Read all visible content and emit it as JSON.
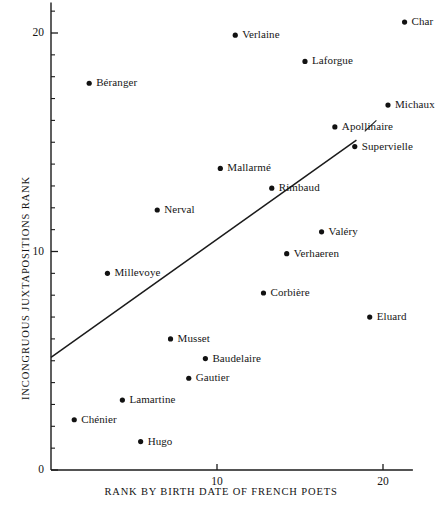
{
  "chart_data": {
    "type": "scatter",
    "title": "",
    "xlabel": "RANK BY BIRTH DATE OF FRENCH POETS",
    "ylabel": "INCONGRUOUS JUXTAPOSITIONS RANK",
    "xlim": [
      0,
      21.8
    ],
    "ylim": [
      0,
      21.4
    ],
    "xticks": [
      10,
      20
    ],
    "xtick_labels": [
      "10",
      "20"
    ],
    "yticks": [
      0,
      10,
      20
    ],
    "ytick_labels": [
      "0",
      "10",
      "20"
    ],
    "xtick_step_minor": 1,
    "ytick_step_minor": 1,
    "grid": false,
    "legend": "none",
    "point_color": "#121212",
    "line_color": "#1b1b1b",
    "axis_color": "#1b1b1b",
    "points": [
      {
        "label": "Char",
        "x": 21.3,
        "y": 20.5,
        "label_side": "right"
      },
      {
        "label": "Verlaine",
        "x": 11.1,
        "y": 19.9,
        "label_side": "right"
      },
      {
        "label": "Laforgue",
        "x": 15.3,
        "y": 18.7,
        "label_side": "right"
      },
      {
        "label": "Béranger",
        "x": 2.3,
        "y": 17.7,
        "label_side": "right"
      },
      {
        "label": "Michaux",
        "x": 20.3,
        "y": 16.7,
        "label_side": "right"
      },
      {
        "label": "Apollinaire",
        "x": 17.1,
        "y": 15.7,
        "label_side": "right"
      },
      {
        "label": "Supervielle",
        "x": 18.3,
        "y": 14.8,
        "label_side": "right"
      },
      {
        "label": "Mallarmé",
        "x": 10.2,
        "y": 13.8,
        "label_side": "right"
      },
      {
        "label": "Rimbaud",
        "x": 13.3,
        "y": 12.9,
        "label_side": "right"
      },
      {
        "label": "Nerval",
        "x": 6.4,
        "y": 11.9,
        "label_side": "right"
      },
      {
        "label": "Valéry",
        "x": 16.3,
        "y": 10.9,
        "label_side": "right"
      },
      {
        "label": "Verhaeren",
        "x": 14.2,
        "y": 9.9,
        "label_side": "right"
      },
      {
        "label": "Millevoye",
        "x": 3.4,
        "y": 9.0,
        "label_side": "right"
      },
      {
        "label": "Corbière",
        "x": 12.8,
        "y": 8.1,
        "label_side": "right"
      },
      {
        "label": "Eluard",
        "x": 19.2,
        "y": 7.0,
        "label_side": "right"
      },
      {
        "label": "Musset",
        "x": 7.2,
        "y": 6.0,
        "label_side": "right"
      },
      {
        "label": "Baudelaire",
        "x": 9.3,
        "y": 5.1,
        "label_side": "right"
      },
      {
        "label": "Gautier",
        "x": 8.3,
        "y": 4.2,
        "label_side": "right"
      },
      {
        "label": "Lamartine",
        "x": 4.3,
        "y": 3.2,
        "label_side": "right"
      },
      {
        "label": "Chénier",
        "x": 1.4,
        "y": 2.3,
        "label_side": "right"
      },
      {
        "label": "Hugo",
        "x": 5.4,
        "y": 1.3,
        "label_side": "right"
      }
    ],
    "trend_line": {
      "x0": 0.0,
      "y0": 5.15,
      "x1": 18.4,
      "y1": 15.1
    },
    "leader_line": {
      "x0": 18.9,
      "y0": 15.5,
      "x1": 19.6,
      "y1": 16.0
    }
  }
}
